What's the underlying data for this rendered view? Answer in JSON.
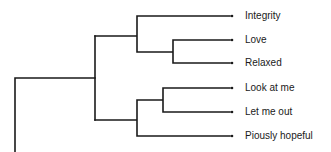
{
  "diagram": {
    "type": "dendrogram",
    "orientation": "left-to-right",
    "line_color": "#1a1a1a",
    "leaves": [
      {
        "label": "Integrity",
        "y": 16
      },
      {
        "label": "Love",
        "y": 40
      },
      {
        "label": "Relaxed",
        "y": 63
      },
      {
        "label": "Look at me",
        "y": 88
      },
      {
        "label": "Let me out",
        "y": 112
      },
      {
        "label": "Piously hopeful",
        "y": 136
      }
    ],
    "clusters": [
      {
        "members": [
          "Love",
          "Relaxed"
        ]
      },
      {
        "members": [
          "Integrity",
          "Love",
          "Relaxed"
        ]
      },
      {
        "members": [
          "Look at me",
          "Let me out"
        ]
      },
      {
        "members": [
          "Look at me",
          "Let me out",
          "Piously hopeful"
        ]
      },
      {
        "members": [
          "Integrity",
          "Love",
          "Relaxed",
          "Look at me",
          "Let me out",
          "Piously hopeful"
        ]
      }
    ]
  }
}
